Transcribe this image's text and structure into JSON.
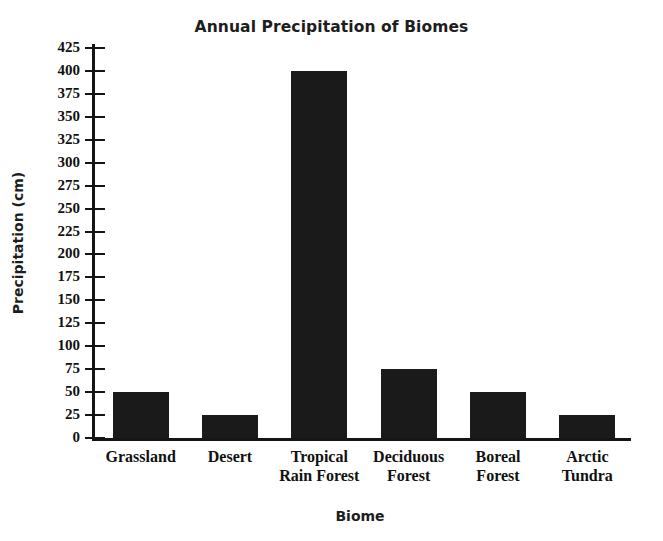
{
  "chart_data": {
    "type": "bar",
    "title": "Annual Precipitation of Biomes",
    "xlabel": "Biome",
    "ylabel": "Precipitation (cm)",
    "categories": [
      "Grassland",
      "Desert",
      "Tropical Rain Forest",
      "Deciduous Forest",
      "Boreal Forest",
      "Arctic Tundra"
    ],
    "category_lines": [
      [
        "Grassland"
      ],
      [
        "Desert"
      ],
      [
        "Tropical",
        "Rain Forest"
      ],
      [
        "Deciduous",
        "Forest"
      ],
      [
        "Boreal",
        "Forest"
      ],
      [
        "Arctic",
        "Tundra"
      ]
    ],
    "values": [
      50,
      25,
      400,
      75,
      50,
      25
    ],
    "ylim": [
      0,
      425
    ],
    "ytick_step": 25,
    "yticks": [
      0,
      25,
      50,
      75,
      100,
      125,
      150,
      175,
      200,
      225,
      250,
      275,
      300,
      325,
      350,
      375,
      400,
      425
    ],
    "ytick_labels": [
      "0",
      "25",
      "50",
      "75",
      "100",
      "125",
      "150",
      "175",
      "200",
      "225",
      "250",
      "275",
      "300",
      "325",
      "350",
      "375",
      "400",
      "425"
    ],
    "grid": false,
    "legend": null,
    "bar_color": "#1a1a1a",
    "axis_color": "#151515",
    "background": "#ffffff"
  }
}
